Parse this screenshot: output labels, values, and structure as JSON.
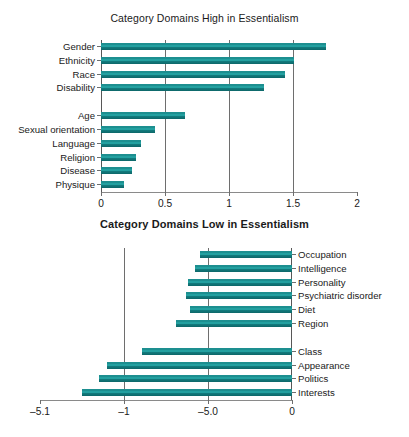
{
  "chart_data": [
    {
      "type": "bar",
      "orientation": "horizontal",
      "title": "Category Domains High in Essentialism",
      "xlabel": "",
      "ylabel": "",
      "xlim": [
        0,
        2
      ],
      "xticks": [
        "0",
        "0.5",
        "1",
        "1.5",
        "2"
      ],
      "xtick_values": [
        0,
        0.5,
        1,
        1.5,
        2
      ],
      "grid": true,
      "grid_axis": "x",
      "legend": "none",
      "bar_color": "#1d8f90",
      "categories": [
        "Gender",
        "Ethnicity",
        "Race",
        "Disability",
        "",
        "Age",
        "Sexual orientation",
        "Language",
        "Religion",
        "Disease",
        "Physique"
      ],
      "values": [
        1.76,
        1.51,
        1.44,
        1.27,
        null,
        0.66,
        0.42,
        0.31,
        0.27,
        0.24,
        0.18
      ]
    },
    {
      "type": "bar",
      "orientation": "horizontal",
      "title": "Category Domains Low in Essentialism",
      "xlabel": "",
      "ylabel": "",
      "xlim": [
        -1.5,
        0
      ],
      "xticks": [
        "–5.1",
        "–1",
        "–5.0",
        "0"
      ],
      "xtick_values": [
        -1.5,
        -1.0,
        -0.5,
        0
      ],
      "grid": true,
      "grid_axis": "x",
      "legend": "none",
      "bar_color": "#1d8f90",
      "categories": [
        "Occupation",
        "Intelligence",
        "Personality",
        "Psychiatric disorder",
        "Diet",
        "Region",
        "",
        "Class",
        "Appearance",
        "Politics",
        "Interests"
      ],
      "values": [
        -0.55,
        -0.58,
        -0.62,
        -0.63,
        -0.61,
        -0.69,
        null,
        -0.89,
        -1.1,
        -1.15,
        -1.25
      ]
    }
  ]
}
